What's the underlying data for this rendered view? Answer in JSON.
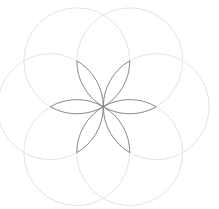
{
  "diagram": {
    "type": "geometric-construction",
    "width": 219,
    "height": 209,
    "background": "#ffffff",
    "center": {
      "x": 103.3,
      "y": 106.7
    },
    "radius": 53,
    "circle_count": 6,
    "petal_count": 6,
    "circle_stroke": "#e4e4e4",
    "circle_stroke_width": 1,
    "petal_stroke": "#7a7a7a",
    "petal_stroke_width": 0.8,
    "start_angle_deg": 0
  }
}
